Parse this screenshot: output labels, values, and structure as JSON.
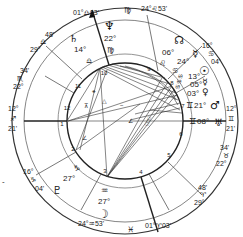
{
  "background_text": {
    "lines": [
      "orld today,",
      "ght out.",
      "peo-",
      "ne"
    ],
    "left_fragment": "-"
  },
  "chart": {
    "colors": {
      "ink": "#222222",
      "line": "#555555",
      "background": "#ffffff"
    },
    "cusps": {
      "mc": {
        "deg": "01°",
        "sign": "♎",
        "min": "03'"
      },
      "ic": {
        "deg": "01°",
        "sign": "♈",
        "min": "03'"
      },
      "asc": {
        "deg": "12°",
        "sign": "♐",
        "min": "21'"
      },
      "dsc": {
        "deg": "12°",
        "sign": "♊",
        "min": "21'"
      },
      "h11": {
        "deg": "29°",
        "sign": "♎",
        "min": "48'"
      },
      "h12": {
        "deg": "22°",
        "sign": "♏",
        "min": "34'"
      },
      "h2": {
        "deg": "16°",
        "sign": "♑",
        "min": "04'"
      },
      "h3": {
        "deg": "24°",
        "sign": "♒",
        "min": "53'"
      },
      "h5": {
        "deg": "29°",
        "sign": "♈",
        "min": "48'"
      },
      "h6": {
        "deg": "22°",
        "sign": "♉",
        "min": "34'"
      },
      "h8": {
        "deg": "16°",
        "sign": "♋",
        "min": "04'"
      },
      "h9": {
        "deg": "24°",
        "sign": "♌",
        "min": "53'"
      }
    },
    "sign_markers": {
      "top": "♍",
      "bottom": "♓"
    },
    "planets": [
      {
        "name": "Neptune",
        "glyph": "♆",
        "deg": "22°",
        "sign": "♍"
      },
      {
        "name": "Saturn",
        "glyph": "♄",
        "deg": "14°",
        "sign": "♎"
      },
      {
        "name": "North Node",
        "glyph": "☊",
        "deg": "06°",
        "sign": "♌"
      },
      {
        "name": "Mercury",
        "glyph": "☿",
        "deg": "24°",
        "sign": "♋"
      },
      {
        "name": "Sun",
        "glyph": "☉",
        "deg": "13°",
        "sign": "♋"
      },
      {
        "name": "Mercury2",
        "glyph": "☿",
        "deg": "05°",
        "sign": "♋"
      },
      {
        "name": "Venus",
        "glyph": "♀",
        "deg": "03°",
        "sign": "♋"
      },
      {
        "name": "Mars",
        "glyph": "♂",
        "deg": "21°",
        "sign": "♊"
      },
      {
        "name": "Uranus",
        "glyph": "♅",
        "deg": "08°",
        "sign": "♊"
      },
      {
        "name": "Pluto",
        "glyph": "♇",
        "deg": "27°",
        "sign": "♑"
      },
      {
        "name": "Moon",
        "glyph": "☽",
        "deg": "27°",
        "sign": "♒"
      }
    ],
    "houses": [
      "1",
      "2",
      "3",
      "4",
      "5",
      "6",
      "7",
      "8",
      "9",
      "10",
      "11",
      "12"
    ]
  }
}
